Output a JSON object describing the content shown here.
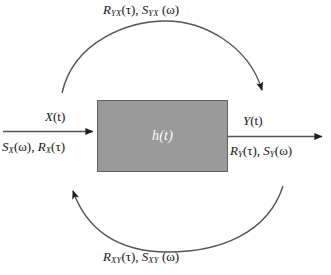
{
  "diagram": {
    "system_block": {
      "label": "h(t)",
      "fill_color": "#9a9a9a",
      "border_color": "#5f5f5f",
      "text_color": "#ffffff"
    },
    "input": {
      "signal_label": "X(t)",
      "stats_label": "S_X(ω), R_X(τ)",
      "stats_parts": {
        "sd_base": "S",
        "sd_sub": "X",
        "sd_arg": "(ω)",
        "sep": ", ",
        "ac_base": "R",
        "ac_sub": "X",
        "ac_arg": "(τ)"
      },
      "signal_parts": {
        "base": "X",
        "arg": "(t)"
      }
    },
    "output": {
      "signal_label": "Y(t)",
      "stats_label": "R_Y(τ), S_Y(ω)",
      "stats_parts": {
        "ac_base": "R",
        "ac_sub": "Y",
        "ac_arg": "(τ)",
        "sep": ", ",
        "sd_base": "S",
        "sd_sub": "Y",
        "sd_arg": "(ω)"
      },
      "signal_parts": {
        "base": "Y",
        "arg": "(t)"
      }
    },
    "cross_top": {
      "label": "R_YX(τ), S_YX(ω)",
      "parts": {
        "ac_base": "R",
        "ac_sub": "YX",
        "ac_arg": "(τ)",
        "sep": ", ",
        "sd_base": "S",
        "sd_sub": "YX",
        "sd_arg": " (ω)"
      }
    },
    "cross_bottom": {
      "label": "R_XY(τ), S_XY(ω)",
      "parts": {
        "ac_base": "R",
        "ac_sub": "XY",
        "ac_arg": "(τ)",
        "sep": ", ",
        "sd_base": "S",
        "sd_sub": "XY",
        "sd_arg": " (ω)"
      }
    },
    "arrows": {
      "input_arrow": "arrow-right",
      "output_arrow": "arrow-right",
      "top_arc_arrow": "arc-arrow-rightward",
      "bottom_arc_arrow": "arc-arrow-leftward",
      "stroke_color": "#555555"
    }
  }
}
